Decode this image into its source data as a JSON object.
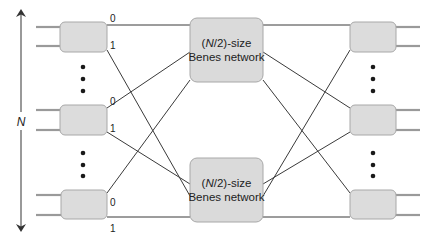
{
  "diagram": {
    "type": "benes-network-recursive-construction",
    "size_label": "N",
    "subnetworks": [
      {
        "id": "top",
        "label_part1": "(",
        "label_italic": "N",
        "label_part2": "/2)-size",
        "line2": "Benes network"
      },
      {
        "id": "bottom",
        "label_part1": "(",
        "label_italic": "N",
        "label_part2": "/2)-size",
        "line2": "Benes network"
      }
    ],
    "left_switches": [
      {
        "id": "left-top",
        "out0": "0",
        "out1": "1"
      },
      {
        "id": "left-middle",
        "out0": "0",
        "out1": "1"
      },
      {
        "id": "left-bottom",
        "out0": "0",
        "out1": "1"
      }
    ],
    "right_switches": [
      {
        "id": "right-top"
      },
      {
        "id": "right-middle"
      },
      {
        "id": "right-bottom"
      }
    ],
    "ellipsis": "•••",
    "colors": {
      "switch_fill": "#dcdcdc",
      "switch_stroke": "#a8a8a8",
      "wire": "#3a3a3a",
      "port": "#9a9a9a"
    }
  }
}
